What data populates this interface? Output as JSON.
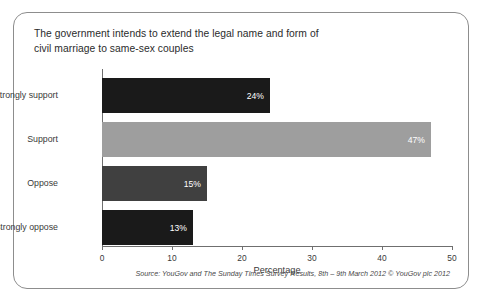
{
  "card": {
    "title_line1": "The government intends to extend the legal name and form of",
    "title_line2": "civil marriage to same-sex couples",
    "source": "Source: YouGov and The Sunday Times Survey Results, 8th – 9th March 2012 © YouGov plc 2012"
  },
  "chart_data": {
    "type": "bar",
    "orientation": "horizontal",
    "title": "The government intends to extend the legal name and form of civil marriage to same-sex couples",
    "categories": [
      "Strongly support",
      "Support",
      "Oppose",
      "Strongly oppose"
    ],
    "values": [
      24,
      47,
      15,
      13
    ],
    "data_labels": [
      "24%",
      "47%",
      "15%",
      "13%"
    ],
    "colors": [
      "#1a1a1a",
      "#9e9e9e",
      "#404040",
      "#1a1a1a"
    ],
    "xlabel": "Percentage",
    "ylabel": "",
    "xlim": [
      0,
      50
    ],
    "xticks": [
      0,
      10,
      20,
      30,
      40,
      50
    ],
    "xtick_labels": [
      "0",
      "10",
      "20",
      "30",
      "40",
      "50"
    ],
    "grid": false,
    "legend": false
  }
}
